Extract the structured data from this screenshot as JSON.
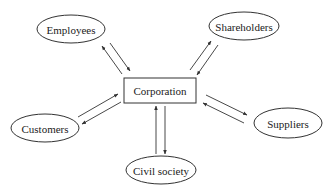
{
  "diagram": {
    "center": {
      "label": "Corporation",
      "x": 124,
      "y": 78,
      "w": 72,
      "h": 25
    },
    "stakeholders": [
      {
        "id": "employees",
        "label": "Employees",
        "cx": 71,
        "cy": 29,
        "rx": 34,
        "ry": 14
      },
      {
        "id": "shareholders",
        "label": "Shareholders",
        "cx": 244,
        "cy": 26,
        "rx": 35,
        "ry": 14
      },
      {
        "id": "customers",
        "label": "Customers",
        "cx": 45,
        "cy": 128,
        "rx": 34,
        "ry": 14
      },
      {
        "id": "suppliers",
        "label": "Suppliers",
        "cx": 288,
        "cy": 123,
        "rx": 34,
        "ry": 15
      },
      {
        "id": "civil-society",
        "label": "Civil society",
        "cx": 161,
        "cy": 170,
        "rx": 35,
        "ry": 14
      }
    ],
    "arrows": [
      {
        "from": "corporation",
        "to": "employees",
        "x1": 122,
        "y1": 74,
        "x2": 102,
        "y2": 46
      },
      {
        "from": "employees",
        "to": "corporation",
        "x1": 110,
        "y1": 43,
        "x2": 130,
        "y2": 71
      },
      {
        "from": "corporation",
        "to": "shareholders",
        "x1": 190,
        "y1": 70,
        "x2": 211,
        "y2": 41
      },
      {
        "from": "shareholders",
        "to": "corporation",
        "x1": 218,
        "y1": 45,
        "x2": 197,
        "y2": 75
      },
      {
        "from": "customers",
        "to": "corporation",
        "x1": 78,
        "y1": 117,
        "x2": 118,
        "y2": 94
      },
      {
        "from": "corporation",
        "to": "customers",
        "x1": 121,
        "y1": 102,
        "x2": 82,
        "y2": 124
      },
      {
        "from": "corporation",
        "to": "suppliers",
        "x1": 206,
        "y1": 95,
        "x2": 247,
        "y2": 115
      },
      {
        "from": "suppliers",
        "to": "corporation",
        "x1": 244,
        "y1": 123,
        "x2": 203,
        "y2": 103
      },
      {
        "from": "civil-society",
        "to": "corporation",
        "x1": 156,
        "y1": 154,
        "x2": 156,
        "y2": 106
      },
      {
        "from": "corporation",
        "to": "civil-society",
        "x1": 165,
        "y1": 106,
        "x2": 165,
        "y2": 154
      }
    ]
  }
}
